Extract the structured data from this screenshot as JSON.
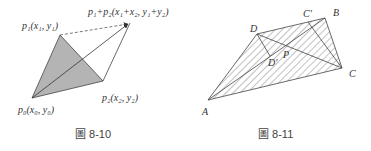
{
  "figures": [
    {
      "caption": "圖 8-10",
      "points": {
        "p0": {
          "x": 32,
          "y": 98,
          "label": "p₀(x₀, y₀)"
        },
        "p1": {
          "x": 60,
          "y": 35,
          "label": "p₁(x₁, y₁)"
        },
        "p2": {
          "x": 103,
          "y": 81,
          "label": "p₂(x₂, y₂)"
        },
        "sum": {
          "x": 130,
          "y": 23,
          "label": "p₁+p₂(x₁+x₂, y₁+y₂)"
        }
      },
      "fill_color": "#b4b4b4",
      "stroke_color": "#444444"
    },
    {
      "caption": "圖 8-11",
      "points": {
        "A": {
          "x": 208,
          "y": 100,
          "label": "A"
        },
        "B": {
          "x": 325,
          "y": 18,
          "label": "B"
        },
        "C": {
          "x": 342,
          "y": 68,
          "label": "C"
        },
        "D": {
          "x": 257,
          "y": 34,
          "label": "D"
        },
        "Cp": {
          "x": 308,
          "y": 20,
          "label": "C′"
        },
        "Dp": {
          "x": 270,
          "y": 56,
          "label": "D′"
        },
        "P": {
          "x": 283,
          "y": 53,
          "label": "P"
        }
      },
      "hatch_color": "#555555"
    }
  ]
}
